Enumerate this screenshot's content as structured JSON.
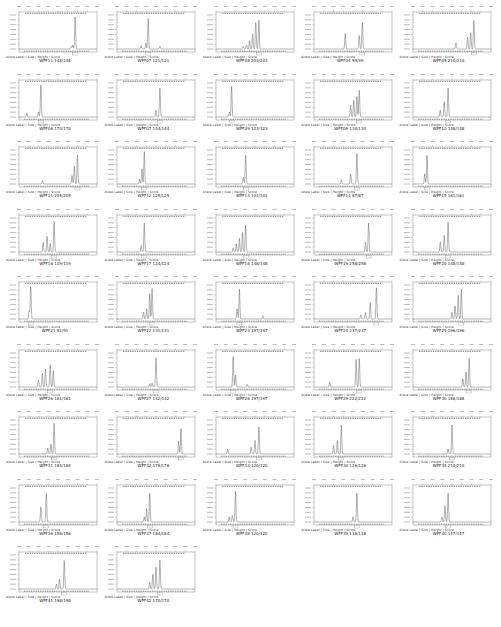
{
  "figure": {
    "caption_header": "Allele Label | Size | Height | Score"
  },
  "chart_data": {
    "type": "line",
    "layout": {
      "columns": 5,
      "rows": 9,
      "grid": false,
      "legend": "none"
    },
    "panels": [
      {
        "label": "WPF11 148/148",
        "peaks": [
          [
            0.72,
            0.95
          ],
          [
            0.69,
            0.12
          ],
          [
            0.67,
            0.08
          ]
        ]
      },
      {
        "label": "WPF07 121/121",
        "peaks": [
          [
            0.4,
            0.9
          ],
          [
            0.37,
            0.18
          ],
          [
            0.31,
            0.1
          ],
          [
            0.55,
            0.08
          ]
        ]
      },
      {
        "label": "WPF08 203/203",
        "peaks": [
          [
            0.55,
            0.85
          ],
          [
            0.51,
            0.8
          ],
          [
            0.47,
            0.45
          ],
          [
            0.43,
            0.25
          ],
          [
            0.39,
            0.12
          ],
          [
            0.35,
            0.08
          ]
        ]
      },
      {
        "label": "WPF04 99/99",
        "peaks": [
          [
            0.62,
            0.78
          ],
          [
            0.4,
            0.45
          ],
          [
            0.58,
            0.4
          ]
        ]
      },
      {
        "label": "WPF05 210/210",
        "peaks": [
          [
            0.78,
            0.85
          ],
          [
            0.74,
            0.5
          ],
          [
            0.7,
            0.35
          ],
          [
            0.55,
            0.18
          ]
        ]
      },
      {
        "label": "WPF06 170/170",
        "peaks": [
          [
            0.28,
            0.95
          ],
          [
            0.25,
            0.15
          ],
          [
            0.1,
            0.12
          ]
        ]
      },
      {
        "label": "WPF07 144/144",
        "peaks": [
          [
            0.55,
            0.85
          ],
          [
            0.5,
            0.2
          ]
        ]
      },
      {
        "label": "WPF09 123/123",
        "peaks": [
          [
            0.2,
            0.9
          ],
          [
            0.17,
            0.15
          ]
        ]
      },
      {
        "label": "WPF09 134/134",
        "peaks": [
          [
            0.58,
            0.8
          ],
          [
            0.55,
            0.6
          ],
          [
            0.51,
            0.5
          ],
          [
            0.47,
            0.35
          ]
        ]
      },
      {
        "label": "WPF10 148/148",
        "peaks": [
          [
            0.45,
            0.85
          ],
          [
            0.4,
            0.45
          ],
          [
            0.35,
            0.2
          ]
        ]
      },
      {
        "label": "WPF11 205/205",
        "peaks": [
          [
            0.75,
            0.85
          ],
          [
            0.71,
            0.55
          ],
          [
            0.68,
            0.25
          ],
          [
            0.3,
            0.1
          ]
        ]
      },
      {
        "label": "WPF12 125/125",
        "peaks": [
          [
            0.35,
            0.95
          ],
          [
            0.32,
            0.45
          ],
          [
            0.29,
            0.15
          ]
        ]
      },
      {
        "label": "WPF13 101/101",
        "peaks": [
          [
            0.38,
            0.85
          ],
          [
            0.35,
            0.2
          ]
        ]
      },
      {
        "label": "WPF14 87/87",
        "peaks": [
          [
            0.55,
            0.9
          ],
          [
            0.47,
            0.3
          ],
          [
            0.35,
            0.12
          ]
        ]
      },
      {
        "label": "WPF15 161/161",
        "peaks": [
          [
            0.18,
            0.85
          ],
          [
            0.15,
            0.3
          ]
        ]
      },
      {
        "label": "WPF16 119/119",
        "peaks": [
          [
            0.45,
            0.9
          ],
          [
            0.36,
            0.48
          ],
          [
            0.31,
            0.3
          ],
          [
            0.4,
            0.25
          ]
        ]
      },
      {
        "label": "WPF17 124/124",
        "peaks": [
          [
            0.35,
            0.85
          ],
          [
            0.31,
            0.2
          ]
        ]
      },
      {
        "label": "WPF18 148/148",
        "peaks": [
          [
            0.38,
            0.8
          ],
          [
            0.34,
            0.6
          ],
          [
            0.3,
            0.4
          ],
          [
            0.26,
            0.25
          ],
          [
            0.22,
            0.12
          ]
        ]
      },
      {
        "label": "WPF19 258/258",
        "peaks": [
          [
            0.7,
            0.85
          ],
          [
            0.66,
            0.3
          ]
        ]
      },
      {
        "label": "WPF20 148/148",
        "peaks": [
          [
            0.45,
            0.88
          ],
          [
            0.4,
            0.5
          ],
          [
            0.35,
            0.3
          ]
        ]
      },
      {
        "label": "WPF21 91/91",
        "peaks": [
          [
            0.15,
            0.95
          ],
          [
            0.13,
            0.25
          ]
        ]
      },
      {
        "label": "WPF22 131/131",
        "peaks": [
          [
            0.45,
            0.9
          ],
          [
            0.42,
            0.75
          ],
          [
            0.38,
            0.3
          ],
          [
            0.34,
            0.2
          ]
        ]
      },
      {
        "label": "WPF23 197/197",
        "peaks": [
          [
            0.3,
            0.88
          ],
          [
            0.27,
            0.3
          ],
          [
            0.6,
            0.1
          ]
        ]
      },
      {
        "label": "WPF24 237/237",
        "peaks": [
          [
            0.8,
            0.92
          ],
          [
            0.72,
            0.5
          ],
          [
            0.66,
            0.2
          ],
          [
            0.6,
            0.12
          ]
        ]
      },
      {
        "label": "WPF25 196/196",
        "peaks": [
          [
            0.62,
            0.88
          ],
          [
            0.58,
            0.7
          ],
          [
            0.54,
            0.4
          ],
          [
            0.5,
            0.2
          ]
        ]
      },
      {
        "label": "WPF26 161/161",
        "peaks": [
          [
            0.4,
            0.65
          ],
          [
            0.34,
            0.55
          ],
          [
            0.3,
            0.4
          ],
          [
            0.44,
            0.5
          ],
          [
            0.25,
            0.2
          ]
        ]
      },
      {
        "label": "WPF27 142/142",
        "peaks": [
          [
            0.5,
            0.85
          ],
          [
            0.45,
            0.12
          ],
          [
            0.42,
            0.1
          ]
        ]
      },
      {
        "label": "WPF28 197/197",
        "peaks": [
          [
            0.22,
            0.9
          ],
          [
            0.25,
            0.35
          ],
          [
            0.4,
            0.08
          ]
        ]
      },
      {
        "label": "WPF29 222/222",
        "peaks": [
          [
            0.58,
            0.85
          ],
          [
            0.54,
            0.85
          ],
          [
            0.2,
            0.15
          ]
        ]
      },
      {
        "label": "WPF30 188/188",
        "peaks": [
          [
            0.72,
            0.85
          ],
          [
            0.68,
            0.45
          ],
          [
            0.64,
            0.25
          ]
        ]
      },
      {
        "label": "WPF31 184/184",
        "peaks": [
          [
            0.45,
            0.9
          ],
          [
            0.41,
            0.3
          ],
          [
            0.37,
            0.18
          ]
        ]
      },
      {
        "label": "WPF32 176/176",
        "peaks": [
          [
            0.82,
            0.75
          ],
          [
            0.79,
            0.4
          ]
        ]
      },
      {
        "label": "WPF33 120/120",
        "peaks": [
          [
            0.55,
            0.8
          ],
          [
            0.5,
            0.4
          ],
          [
            0.45,
            0.2
          ],
          [
            0.15,
            0.15
          ]
        ]
      },
      {
        "label": "WPF34 126/126",
        "peaks": [
          [
            0.35,
            0.85
          ],
          [
            0.3,
            0.4
          ],
          [
            0.25,
            0.25
          ]
        ]
      },
      {
        "label": "WPF35 210/210",
        "peaks": [
          [
            0.5,
            0.85
          ],
          [
            0.45,
            0.15
          ]
        ]
      },
      {
        "label": "WPF36 156/156",
        "peaks": [
          [
            0.35,
            0.85
          ],
          [
            0.28,
            0.45
          ]
        ]
      },
      {
        "label": "WPF37 184/184",
        "peaks": [
          [
            0.42,
            0.85
          ],
          [
            0.38,
            0.4
          ],
          [
            0.35,
            0.15
          ]
        ]
      },
      {
        "label": "WPF38 120/120",
        "peaks": [
          [
            0.25,
            0.9
          ],
          [
            0.21,
            0.2
          ],
          [
            0.17,
            0.15
          ]
        ]
      },
      {
        "label": "WPF39 118/118",
        "peaks": [
          [
            0.55,
            0.85
          ],
          [
            0.5,
            0.15
          ]
        ]
      },
      {
        "label": "WPF40 147/147",
        "peaks": [
          [
            0.45,
            0.85
          ],
          [
            0.41,
            0.5
          ],
          [
            0.37,
            0.15
          ]
        ]
      },
      {
        "label": "WPF41 198/198",
        "peaks": [
          [
            0.58,
            0.85
          ],
          [
            0.52,
            0.3
          ],
          [
            0.48,
            0.15
          ]
        ]
      },
      {
        "label": "WPF42 170/170",
        "peaks": [
          [
            0.55,
            0.85
          ],
          [
            0.5,
            0.65
          ],
          [
            0.46,
            0.45
          ],
          [
            0.42,
            0.2
          ]
        ]
      }
    ],
    "xlabel": "Size (bp)",
    "ylabel": "RFU"
  }
}
